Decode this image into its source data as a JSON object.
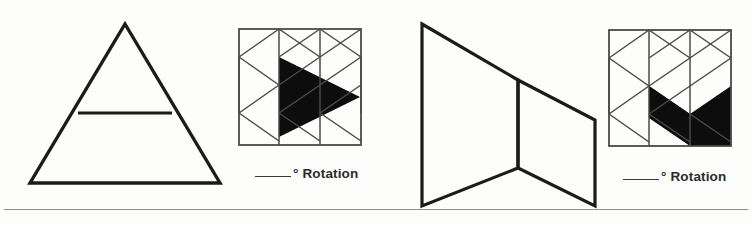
{
  "page": {
    "background_color": "#fdfdfc",
    "ink_color": "#1b1b1b",
    "divider_color": "#8e9094",
    "width": 751,
    "height": 225
  },
  "problems": [
    {
      "id": "problem-1",
      "prompt_figure": {
        "name": "triangle-with-horizontal-line",
        "description": "Large outlined triangle with a horizontal line crossing the upper portion",
        "stroke_color": "#1b1b1b",
        "stroke_width": 3.2,
        "vertices": [
          [
            103,
            8
          ],
          [
            198,
            167
          ],
          [
            8,
            167
          ]
        ],
        "inner_line": [
          [
            56,
            97
          ],
          [
            150,
            97
          ]
        ]
      },
      "answer_grid": {
        "name": "triangular-lattice-grid-shaded",
        "columns": 3,
        "rows": 4,
        "border_color": "#4a4a4a",
        "lattice_color": "#4a4a4a",
        "shade_color": "#0d0d0d",
        "shaded_shape": "large right-pointing triangle spanning the center and right of the lattice"
      },
      "answer": {
        "blank": "",
        "label": "° Rotation",
        "full_text": "_____° Rotation"
      }
    },
    {
      "id": "problem-2",
      "prompt_figure": {
        "name": "double-parallelogram-zigzag",
        "description": "Two joined parallelograms forming an N / zigzag outline",
        "stroke_color": "#1b1b1b",
        "stroke_width": 3.2,
        "vertices_left": [
          [
            12,
            14
          ],
          [
            108,
            70
          ],
          [
            108,
            158
          ],
          [
            12,
            196
          ]
        ],
        "vertices_right": [
          [
            108,
            70
          ],
          [
            185,
            110
          ],
          [
            185,
            196
          ],
          [
            108,
            158
          ]
        ]
      },
      "answer_grid": {
        "name": "triangular-lattice-grid-shaded",
        "columns": 3,
        "rows": 4,
        "border_color": "#4a4a4a",
        "lattice_color": "#4a4a4a",
        "shade_color": "#0d0d0d",
        "shaded_shape": "chevron / arrow band shaded across the right-center of the lattice"
      },
      "answer": {
        "blank": "",
        "label": "° Rotation",
        "full_text": "_____° Rotation"
      }
    }
  ]
}
